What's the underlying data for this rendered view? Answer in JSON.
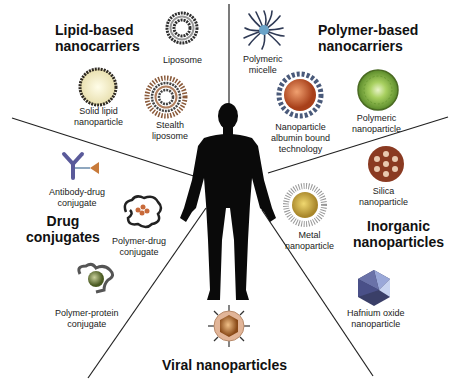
{
  "categories": {
    "lipid": "Lipid-based",
    "lipid2": "nanocarriers",
    "polymer": "Polymer-based",
    "polymer2": "nanocarriers",
    "drug": "Drug",
    "drug2": "conjugates",
    "inorganic": "Inorganic",
    "inorganic2": "nanoparticles",
    "viral": "Viral nanoparticles"
  },
  "items": {
    "liposome": "Liposome",
    "solid_lipid_1": "Solid lipid",
    "solid_lipid_2": "nanoparticle",
    "stealth_1": "Stealth",
    "stealth_2": "liposome",
    "micelle_1": "Polymeric",
    "micelle_2": "micelle",
    "nab_1": "Nanoparticle",
    "nab_2": "albumin bound",
    "nab_3": "technology",
    "polynp_1": "Polymeric",
    "polynp_2": "nanoparticle",
    "adc_1": "Antibody-drug",
    "adc_2": "conjugate",
    "pdc_1": "Polymer-drug",
    "pdc_2": "conjugate",
    "ppc_1": "Polymer-protein",
    "ppc_2": "conjugate",
    "silica_1": "Silica",
    "silica_2": "nanoparticle",
    "metal_1": "Metal",
    "metal_2": "nanoparticle",
    "hafnium_1": "Hafnium oxide",
    "hafnium_2": "nanoparticle"
  },
  "colors": {
    "line": "#222222",
    "silhouette": "#0a0a0a",
    "liposome": "#3a3a3a",
    "solid_lipid_fill": "#f3efd0",
    "polymer_np": "#8cbc3c",
    "nab_core": "#c8552a",
    "silica": "#8a3a22",
    "metal": "#c9a63a",
    "hafnium": "#4a4f78",
    "viral_shell": "#e2b598",
    "viral_core": "#9a5a20",
    "antibody": "#5a5a9a",
    "drug": "#c87a3a",
    "protein": "#6a7a3a"
  }
}
